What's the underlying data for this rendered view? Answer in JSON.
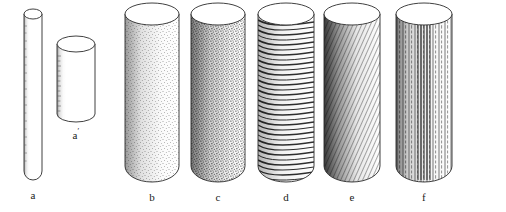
{
  "figure": {
    "kind": "line-drawing",
    "background_color": "#ffffff",
    "ink_color": "#2b2b2b",
    "label_color": "#1a1a1a",
    "caption_present": false,
    "specimens": [
      {
        "id": "a",
        "label": "a",
        "label_prime": "",
        "surface": "plain-outline",
        "surface_description": "slender unshaded cylinder with light stipple along left contour",
        "center_x": 33,
        "label_x": 33,
        "label_y": 196,
        "top_y": 14,
        "bottom_y": 180,
        "radius_x": 9,
        "radius_y": 5,
        "bottom_rounded": true
      },
      {
        "id": "a-prime",
        "label": "a",
        "label_prime": "′",
        "surface": "plain-outline",
        "surface_description": "short wide cylinder, faint hatch ticks on left edge",
        "center_x": 76,
        "label_x": 76,
        "label_y": 136,
        "top_y": 44,
        "bottom_y": 122,
        "radius_x": 19,
        "radius_y": 8,
        "bottom_rounded": true
      },
      {
        "id": "b",
        "label": "b",
        "label_prime": "",
        "surface": "stipple-fine",
        "surface_description": "fine even stippling, light tone, graded toward left",
        "center_x": 152,
        "label_x": 152,
        "label_y": 198,
        "top_y": 14,
        "bottom_y": 182,
        "radius_x": 27,
        "radius_y": 11,
        "bottom_rounded": true
      },
      {
        "id": "c",
        "label": "c",
        "label_prime": "",
        "surface": "stipple-coarse",
        "surface_description": "denser coarser stippling, darker overall tone",
        "center_x": 218,
        "label_x": 218,
        "label_y": 198,
        "top_y": 14,
        "bottom_y": 182,
        "radius_x": 27,
        "radius_y": 11,
        "bottom_rounded": true
      },
      {
        "id": "d",
        "label": "d",
        "label_prime": "",
        "surface": "transverse-rings",
        "surface_description": "closely spaced horizontal curved ring hatching around circumference",
        "center_x": 286,
        "label_x": 286,
        "label_y": 198,
        "top_y": 14,
        "bottom_y": 182,
        "radius_x": 28,
        "radius_y": 11,
        "bottom_rounded": true
      },
      {
        "id": "e",
        "label": "e",
        "label_prime": "",
        "surface": "diagonal-hatch",
        "surface_description": "oblique hatch lines descending left to right, dense on left flank",
        "center_x": 352,
        "label_x": 352,
        "label_y": 198,
        "top_y": 14,
        "bottom_y": 182,
        "radius_x": 28,
        "radius_y": 11,
        "bottom_rounded": true
      },
      {
        "id": "f",
        "label": "f",
        "label_prime": "",
        "surface": "vertical-striations",
        "surface_description": "long vertical lines, mixed solid and dashed, parallel to axis",
        "center_x": 424,
        "label_x": 424,
        "label_y": 198,
        "top_y": 14,
        "bottom_y": 182,
        "radius_x": 28,
        "radius_y": 11,
        "bottom_rounded": true
      }
    ]
  }
}
